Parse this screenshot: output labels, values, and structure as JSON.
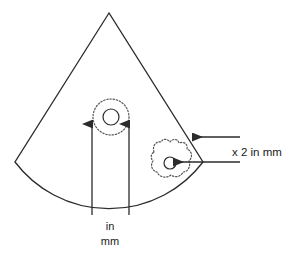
{
  "figure": {
    "type": "ultrasound-sector-schematic",
    "background_color": "#ffffff",
    "stroke_color": "#2b2b2b",
    "dotted_stroke_color": "#555555"
  },
  "labels": {
    "side_label": "x 2 in mm",
    "bottom_label_line1": "in",
    "bottom_label_line2": "mm"
  },
  "annotations": {
    "upper_lesion_name": "upper-lesion-dotted-circle",
    "lower_lesion_name": "lower-lesion-dotted-blob",
    "sector_name": "ultrasound-sector-outline"
  },
  "geometry": {
    "sector_apex": [
      109,
      13
    ],
    "sector_left_corner": [
      15,
      162
    ],
    "sector_right_corner": [
      203,
      162
    ],
    "arc_bottom_y": 203,
    "upper_circle_center": [
      111,
      117
    ],
    "upper_circle_outer_radius": 18,
    "upper_circle_inner_radius": 8,
    "lower_blob_center": [
      171,
      159
    ],
    "lower_blob_inner_circle_center": [
      170,
      163
    ],
    "lower_blob_inner_radius": 6,
    "vertical_arrow_left_x": 92,
    "vertical_arrow_right_x": 129,
    "vertical_arrow_tip_y": 122,
    "vertical_arrow_base_y": 215,
    "horizontal_arrow_upper_y": 137,
    "horizontal_arrow_lower_y": 162,
    "horizontal_arrow_right_x": 240
  }
}
